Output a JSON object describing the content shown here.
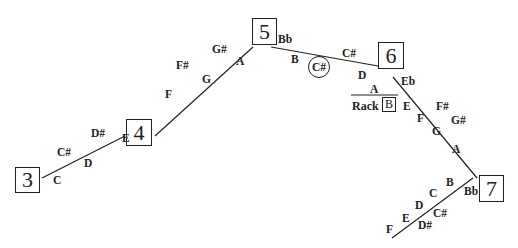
{
  "diagram": {
    "type": "trombone-slide-position-chart",
    "positions": [
      {
        "id": "3",
        "label": "3"
      },
      {
        "id": "4",
        "label": "4"
      },
      {
        "id": "5",
        "label": "5"
      },
      {
        "id": "6",
        "label": "6"
      },
      {
        "id": "7",
        "label": "7"
      }
    ],
    "segments": [
      {
        "from": "3",
        "to": "4",
        "above": [
          "C#",
          "D#"
        ],
        "below": [
          "C",
          "D",
          "E"
        ]
      },
      {
        "from": "4",
        "to": "5",
        "above": [
          "F#",
          "G#"
        ],
        "below": [
          "F",
          "G",
          "A"
        ]
      },
      {
        "from": "5",
        "to": "6",
        "above": [
          "Bb",
          "C#"
        ],
        "below": [
          "B",
          "C#",
          "D"
        ],
        "circled": "C#"
      },
      {
        "from": "6",
        "to": "7",
        "above": [
          "Eb",
          "F#",
          "G#"
        ],
        "below": [
          "E",
          "F",
          "G",
          "A"
        ]
      },
      {
        "from": "7",
        "to": "extension",
        "above": [
          "B",
          "C",
          "D",
          "E",
          "F"
        ],
        "below": [
          "Bb",
          "C#",
          "D#"
        ]
      }
    ],
    "rack": {
      "label": "Rack",
      "note": "B",
      "above_line": "A"
    },
    "notes": {
      "n_c": "C",
      "n_cs1": "C#",
      "n_d1": "D",
      "n_ds1": "D#",
      "n_e1": "E",
      "n_f1": "F",
      "n_fs1": "F#",
      "n_g1": "G",
      "n_gs1": "G#",
      "n_a1": "A",
      "n_bb1": "Bb",
      "n_b1": "B",
      "n_cs_circ": "C#",
      "n_cs2": "C#",
      "n_d2": "D",
      "n_eb": "Eb",
      "n_e2": "E",
      "n_f2": "F",
      "n_fs2": "F#",
      "n_g2": "G",
      "n_gs2": "G#",
      "n_a2": "A",
      "n_b2": "B",
      "n_bb2": "Bb",
      "n_c3": "C",
      "n_d3": "D",
      "n_cs3": "C#",
      "n_e3": "E",
      "n_ds3": "D#",
      "n_f3": "F",
      "rack_a": "A",
      "rack_label": "Rack",
      "rack_b": "B"
    }
  }
}
